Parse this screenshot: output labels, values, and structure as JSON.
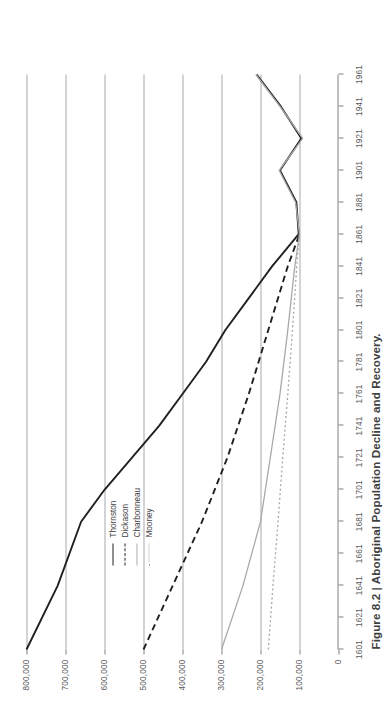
{
  "caption": "Figure 8.2 | Aboriginal Population Decline and Recovery.",
  "legend": {
    "items": [
      {
        "label": "Thornston",
        "color": "#231f20",
        "style": "solid",
        "width": 1.9
      },
      {
        "label": "Dickason",
        "color": "#231f20",
        "style": "dashed",
        "width": 1.9
      },
      {
        "label": "Charbonneau",
        "color": "#a7a9ac",
        "style": "solid",
        "width": 1.3
      },
      {
        "label": "Mooney",
        "color": "#a7a9ac",
        "style": "dotted",
        "width": 1.3
      }
    ]
  },
  "colors": {
    "line_dark": "#231f20",
    "line_gray": "#a7a9ac",
    "grid": "#a7a9ac",
    "axis": "#808285",
    "text": "#58595b",
    "caption_text": "#404041",
    "background": "#ffffff"
  },
  "chart_data": {
    "type": "line",
    "title": "",
    "xlabel": "",
    "ylabel": "",
    "xlim": [
      1601,
      1961
    ],
    "ylim": [
      0,
      800000
    ],
    "grid": true,
    "legend_position": "upper-center",
    "x_ticks": [
      1601,
      1621,
      1641,
      1661,
      1681,
      1701,
      1721,
      1741,
      1761,
      1781,
      1801,
      1821,
      1841,
      1861,
      1881,
      1901,
      1921,
      1941,
      1961
    ],
    "y_ticks": [
      0,
      100000,
      200000,
      300000,
      400000,
      500000,
      600000,
      700000,
      800000
    ],
    "y_tick_labels": [
      "0",
      "100,000",
      "200,000",
      "300,000",
      "400,000",
      "500,000",
      "600,000",
      "700,000",
      "800,000"
    ],
    "x_tick_labels": [
      "1601",
      "1621",
      "1641",
      "1661",
      "1681",
      "1701",
      "1721",
      "1741",
      "1761",
      "1781",
      "1801",
      "1821",
      "1841",
      "1861",
      "1881",
      "1901",
      "1921",
      "1941",
      "1961"
    ],
    "series": [
      {
        "name": "Thornston",
        "style": "solid",
        "color": "#231f20",
        "x": [
          1601,
          1641,
          1681,
          1701,
          1721,
          1741,
          1761,
          1781,
          1801,
          1821,
          1841,
          1861,
          1881,
          1901,
          1921,
          1941,
          1961
        ],
        "y": [
          800000,
          720000,
          660000,
          600000,
          530000,
          460000,
          400000,
          340000,
          290000,
          230000,
          170000,
          102000,
          108000,
          150000,
          95000,
          148000,
          210000
        ]
      },
      {
        "name": "Dickason",
        "style": "dashed",
        "color": "#231f20",
        "x": [
          1601,
          1641,
          1681,
          1721,
          1761,
          1801,
          1841,
          1861
        ],
        "y": [
          500000,
          425000,
          350000,
          285000,
          230000,
          180000,
          130000,
          100000
        ]
      },
      {
        "name": "Charbonneau",
        "style": "solid",
        "color": "#a7a9ac",
        "x": [
          1601,
          1641,
          1681,
          1721,
          1761,
          1801,
          1841,
          1861,
          1881,
          1901,
          1921,
          1941,
          1961
        ],
        "y": [
          300000,
          245000,
          200000,
          175000,
          150000,
          130000,
          112000,
          100000,
          110000,
          152000,
          92000,
          150000,
          212000
        ]
      },
      {
        "name": "Mooney",
        "style": "dotted",
        "color": "#a7a9ac",
        "x": [
          1601,
          1641,
          1681,
          1721,
          1761,
          1801,
          1841,
          1861
        ],
        "y": [
          180000,
          168000,
          155000,
          143000,
          130000,
          118000,
          107000,
          100000
        ]
      }
    ],
    "annotations": []
  }
}
